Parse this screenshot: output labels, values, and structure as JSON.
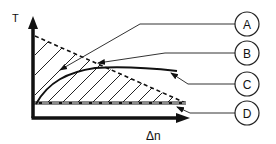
{
  "diagram": {
    "axes": {
      "y_label": "T",
      "x_label": "Δn"
    },
    "callouts": [
      {
        "id": "A",
        "label": "A",
        "points_to": "hatched-region"
      },
      {
        "id": "B",
        "label": "B",
        "points_to": "dashed-diagonal-line"
      },
      {
        "id": "C",
        "label": "C",
        "points_to": "solid-curve"
      },
      {
        "id": "D",
        "label": "D",
        "points_to": "dashed-horizontal-line"
      }
    ],
    "colors": {
      "ink": "#111111",
      "leader": "#333333",
      "background": "#ffffff"
    }
  }
}
